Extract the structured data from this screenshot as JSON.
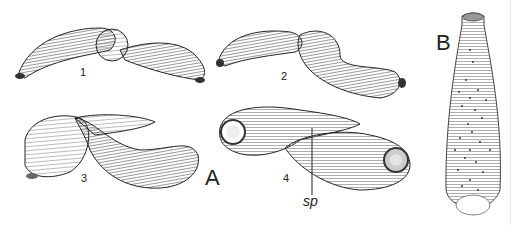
{
  "figure": {
    "panels": [
      {
        "id": "A",
        "label": "A",
        "subfigures": [
          {
            "label": "1"
          },
          {
            "label": "2"
          },
          {
            "label": "3"
          },
          {
            "label": "4",
            "annotation": "sp"
          }
        ]
      },
      {
        "id": "B",
        "label": "B"
      }
    ],
    "colors": {
      "ink": "#222222",
      "shade": "#888888",
      "paper": "#ffffff"
    }
  }
}
